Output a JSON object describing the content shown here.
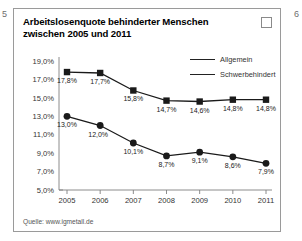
{
  "page_markers": {
    "left": "5",
    "right": "6"
  },
  "card": {
    "title": "Arbeitslosenquote behinderter Menschen zwischen 2005 und 2011",
    "checkbox_name": "checkbox",
    "source": "Quelle: www.igmetall.de"
  },
  "chart_data": {
    "type": "line",
    "title": "Arbeitslosenquote behinderter Menschen zwischen 2005 und 2011",
    "xlabel": "",
    "ylabel": "",
    "categories": [
      "2005",
      "2006",
      "2007",
      "2008",
      "2009",
      "2010",
      "2011"
    ],
    "ytick_labels": [
      "19,0%",
      "17,0%",
      "15,0%",
      "13,0%",
      "11,0%",
      "9,0%",
      "7,0%",
      "5,0%"
    ],
    "ytick_values": [
      19.0,
      17.0,
      15.0,
      13.0,
      11.0,
      9.0,
      7.0,
      5.0
    ],
    "ylim": [
      5.0,
      19.0
    ],
    "grid": false,
    "legend_position": "top-right",
    "series": [
      {
        "name": "Allgemein",
        "marker": "circle",
        "values": [
          13.0,
          12.0,
          10.1,
          8.7,
          9.1,
          8.6,
          7.9
        ],
        "labels": [
          "13,0%",
          "12,0%",
          "10,1%",
          "8,7%",
          "9,1%",
          "8,6%",
          "7,9%"
        ]
      },
      {
        "name": "Schwerbehindert",
        "marker": "square",
        "values": [
          17.8,
          17.7,
          15.8,
          14.7,
          14.6,
          14.8,
          14.8
        ],
        "labels": [
          "17,8%",
          "17,7%",
          "15,8%",
          "14,7%",
          "14,6%",
          "14,8%",
          "14,8%"
        ]
      }
    ]
  }
}
